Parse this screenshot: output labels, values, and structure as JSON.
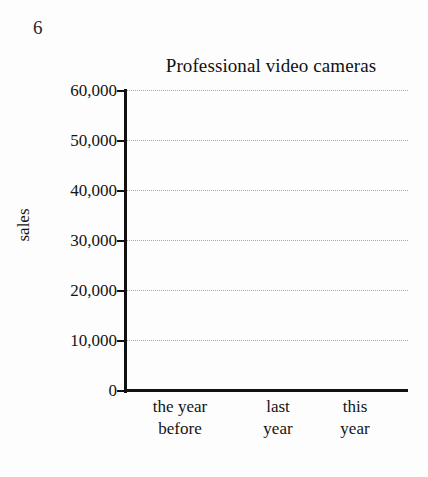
{
  "page": {
    "number": "6",
    "background_color": "#fdfdfd",
    "ink_color": "#111111",
    "gridline_color": "#9a9a9a"
  },
  "chart_data": {
    "type": "bar",
    "title": "Professional video cameras",
    "xlabel": "",
    "ylabel": "sales",
    "categories": [
      "the year before",
      "last year",
      "this year"
    ],
    "category_lines": [
      [
        "the year",
        "before"
      ],
      [
        "last",
        "year"
      ],
      [
        "this",
        "year"
      ]
    ],
    "values": [
      null,
      null,
      null
    ],
    "series": [
      {
        "name": "sales",
        "values": [
          null,
          null,
          null
        ]
      }
    ],
    "ylim": [
      0,
      60000
    ],
    "ytick_values": [
      0,
      10000,
      20000,
      30000,
      40000,
      50000,
      60000
    ],
    "ytick_labels": [
      "0",
      "10,000",
      "20,000",
      "30,000",
      "40,000",
      "50,000",
      "60,000"
    ],
    "grid": true,
    "grid_axis": "y",
    "grid_style": "dotted",
    "legend": false,
    "legend_position": "none"
  }
}
